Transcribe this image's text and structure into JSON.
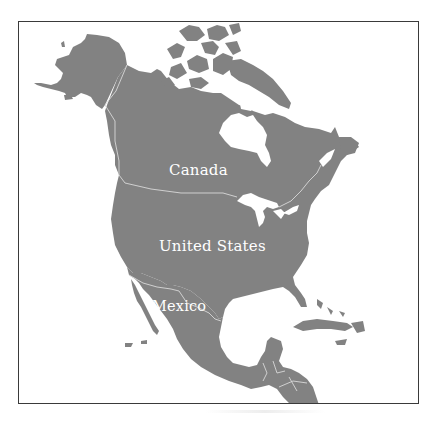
{
  "map": {
    "title": "",
    "region": "North America",
    "colors": {
      "land": "#828282",
      "water": "#ffffff",
      "borders": "#d8d8d8",
      "label_text": "#ffffff",
      "frame": "#3a3a3a"
    },
    "labels": [
      {
        "id": "canada",
        "text": "Canada"
      },
      {
        "id": "united-states",
        "text": "United States"
      },
      {
        "id": "mexico",
        "text": "Mexico"
      }
    ]
  }
}
